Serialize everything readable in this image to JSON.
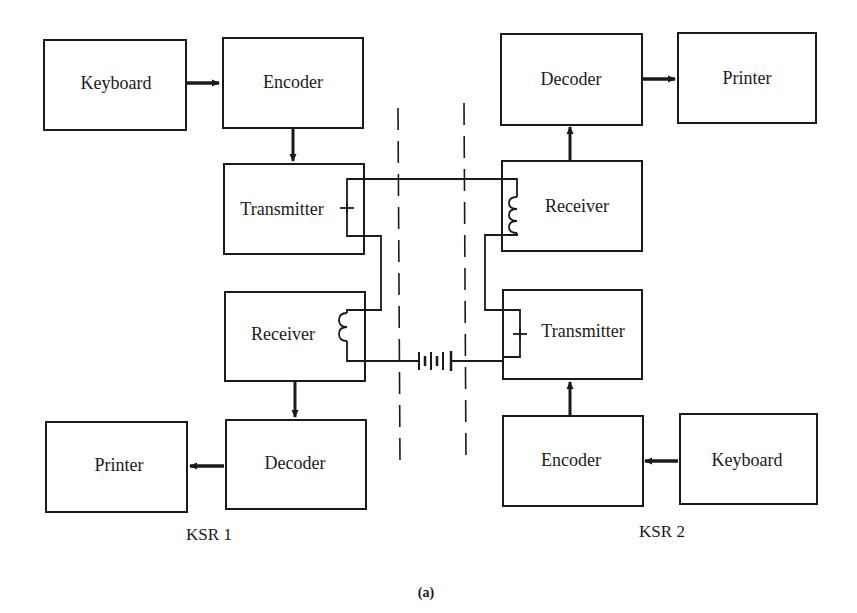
{
  "figure": {
    "label": "(a)",
    "stations": [
      {
        "id": "ksr1",
        "caption": "KSR 1",
        "blocks": {
          "keyboard": "Keyboard",
          "encoder": "Encoder",
          "transmitter": "Transmitter",
          "receiver": "Receiver",
          "decoder": "Decoder",
          "printer": "Printer"
        }
      },
      {
        "id": "ksr2",
        "caption": "KSR 2",
        "blocks": {
          "decoder": "Decoder",
          "printer": "Printer",
          "receiver": "Receiver",
          "transmitter": "Transmitter",
          "encoder": "Encoder",
          "keyboard": "Keyboard"
        }
      }
    ],
    "connections": [
      {
        "from": "ksr1.keyboard",
        "to": "ksr1.encoder",
        "type": "arrow"
      },
      {
        "from": "ksr1.encoder",
        "to": "ksr1.transmitter",
        "type": "arrow"
      },
      {
        "from": "ksr1.receiver",
        "to": "ksr1.decoder",
        "type": "arrow"
      },
      {
        "from": "ksr1.decoder",
        "to": "ksr1.printer",
        "type": "arrow"
      },
      {
        "from": "ksr2.keyboard",
        "to": "ksr2.encoder",
        "type": "arrow"
      },
      {
        "from": "ksr2.encoder",
        "to": "ksr2.transmitter",
        "type": "arrow"
      },
      {
        "from": "ksr2.receiver",
        "to": "ksr2.decoder",
        "type": "arrow"
      },
      {
        "from": "ksr2.decoder",
        "to": "ksr2.printer",
        "type": "arrow"
      },
      {
        "from": "ksr1.transmitter",
        "to": "ksr2.receiver",
        "type": "current-loop-wire"
      },
      {
        "from": "ksr1.receiver",
        "to": "ksr2.transmitter",
        "type": "current-loop-wire-with-battery"
      }
    ],
    "symbols": {
      "transmitter_contact": "switch-contact",
      "receiver_coil": "inductor-coil",
      "line_source": "battery"
    },
    "colors": {
      "ink": "#1a1a1a",
      "background": "#ffffff"
    }
  }
}
